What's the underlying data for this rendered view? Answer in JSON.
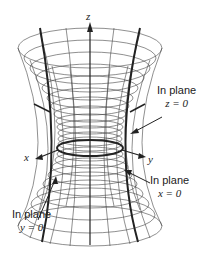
{
  "figure": {
    "axes": {
      "x": "x",
      "y": "y",
      "z": "z"
    },
    "labels": [
      {
        "id": "z0",
        "line1": "In plane",
        "line2": "z = 0"
      },
      {
        "id": "x0",
        "line1": "In plane",
        "line2": "x = 0"
      },
      {
        "id": "y0",
        "line1": "In plane",
        "line2": "y = 0"
      }
    ]
  }
}
